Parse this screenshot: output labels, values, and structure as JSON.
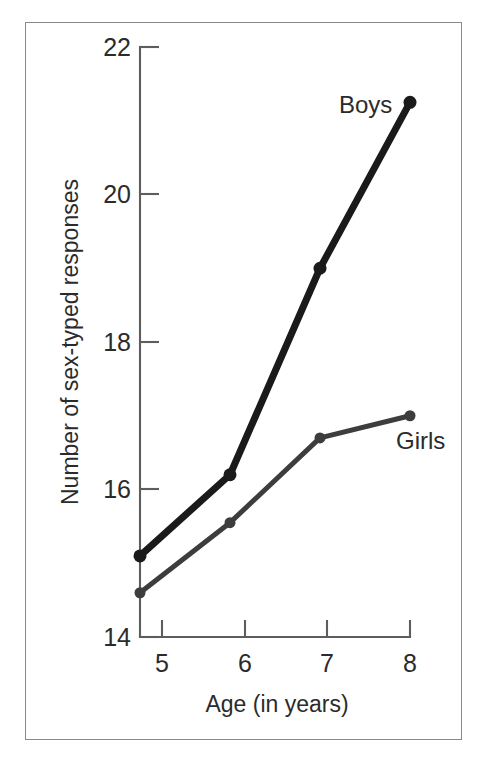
{
  "figure": {
    "frame_color": "#8a8a8a",
    "background_color": "#ffffff",
    "axis_color": "#5d5d5d",
    "text_color": "#2b2b2b"
  },
  "axes": {
    "x_title": "Age (in years)",
    "y_title": "Number of sex-typed responses",
    "x_tick_labels": [
      "5",
      "6",
      "7",
      "8"
    ],
    "y_tick_labels": [
      "14",
      "16",
      "18",
      "20",
      "22"
    ]
  },
  "series_labels": {
    "boys": "Boys",
    "girls": "Girls"
  },
  "chart_data": {
    "type": "line",
    "title": "",
    "subtitle": "",
    "xlabel": "Age (in years)",
    "ylabel": "Number of sex-typed responses",
    "x": [
      5,
      6,
      7,
      8
    ],
    "xlim": [
      5,
      8
    ],
    "ylim": [
      14,
      22
    ],
    "xticks": [
      5,
      6,
      7,
      8
    ],
    "yticks": [
      14,
      16,
      18,
      20,
      22
    ],
    "grid": false,
    "legend": "inline-endpoint-labels",
    "series": [
      {
        "name": "Boys",
        "values": [
          15.1,
          16.2,
          19.0,
          21.25
        ],
        "color": "#1a1a1a",
        "line_width": 7,
        "marker": "circle",
        "marker_size": 13,
        "label_position": "above-right-of-last-point"
      },
      {
        "name": "Girls",
        "values": [
          14.6,
          15.55,
          16.7,
          17.0
        ],
        "color": "#3d3d3d",
        "line_width": 5,
        "marker": "circle",
        "marker_size": 11,
        "label_position": "below-right-of-last-point"
      }
    ],
    "annotations": [
      {
        "text": "Boys",
        "x": 7.6,
        "y": 21.7
      },
      {
        "text": "Girls",
        "x": 8.15,
        "y": 16.55
      }
    ]
  }
}
